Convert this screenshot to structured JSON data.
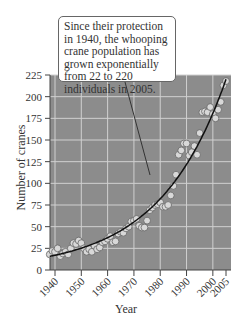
{
  "chart_data": {
    "type": "scatter",
    "title": "",
    "annotation": "Since their protection in 1940, the whooping crane population has grown exponentially from 22 to 220 individuals in 2005.",
    "xlabel": "Year",
    "ylabel": "Number of cranes",
    "xlim": [
      1940,
      2005
    ],
    "ylim": [
      0,
      225
    ],
    "x_ticks": [
      "1940",
      "1950",
      "1960",
      "1970",
      "1980",
      "1990",
      "2000",
      "2005"
    ],
    "y_ticks": [
      "0",
      "25",
      "50",
      "75",
      "100",
      "125",
      "150",
      "175",
      "200",
      "225"
    ],
    "grid": true,
    "plot_bg": "#8c8c8c",
    "marker_color": "#d8d8d8",
    "curve": {
      "type": "exponential",
      "start": [
        1940,
        17
      ],
      "end": [
        2005,
        220
      ]
    },
    "series": [
      {
        "name": "Whooping crane count",
        "x": [
          1938,
          1939,
          1940,
          1941,
          1942,
          1943,
          1944,
          1945,
          1946,
          1947,
          1948,
          1949,
          1950,
          1951,
          1952,
          1953,
          1954,
          1955,
          1956,
          1957,
          1958,
          1959,
          1960,
          1961,
          1962,
          1963,
          1964,
          1965,
          1966,
          1967,
          1968,
          1969,
          1970,
          1971,
          1972,
          1973,
          1974,
          1975,
          1976,
          1977,
          1978,
          1979,
          1980,
          1981,
          1982,
          1983,
          1984,
          1985,
          1986,
          1987,
          1988,
          1989,
          1990,
          1991,
          1992,
          1993,
          1994,
          1995,
          1996,
          1997,
          1998,
          1999,
          2000,
          2001,
          2002,
          2003,
          2004,
          2005
        ],
        "y": [
          18,
          22,
          21,
          25,
          16,
          19,
          21,
          18,
          25,
          31,
          30,
          34,
          31,
          25,
          21,
          24,
          21,
          28,
          24,
          26,
          32,
          33,
          36,
          39,
          32,
          33,
          42,
          44,
          43,
          48,
          50,
          56,
          57,
          59,
          51,
          49,
          49,
          57,
          69,
          72,
          75,
          76,
          78,
          73,
          73,
          75,
          86,
          97,
          110,
          133,
          138,
          146,
          146,
          132,
          136,
          143,
          133,
          158,
          182,
          183,
          182,
          188,
          180,
          175,
          185,
          194,
          213,
          218
        ]
      }
    ]
  }
}
